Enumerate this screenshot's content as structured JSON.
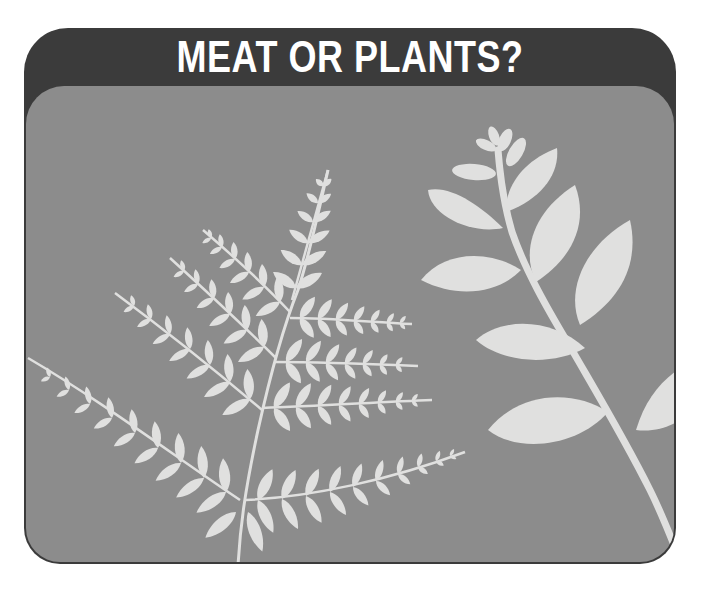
{
  "header": {
    "title": "MEAT OR PLANTS?"
  },
  "illustration": {
    "description": "Silhouettes of a fern frond and a leafy branch",
    "elements": [
      "fern-frond",
      "leafy-branch"
    ]
  },
  "colors": {
    "frame": "#3b3b3b",
    "panel": "#8c8c8c",
    "foliage": "#e0e0df",
    "title_text": "#ffffff"
  }
}
